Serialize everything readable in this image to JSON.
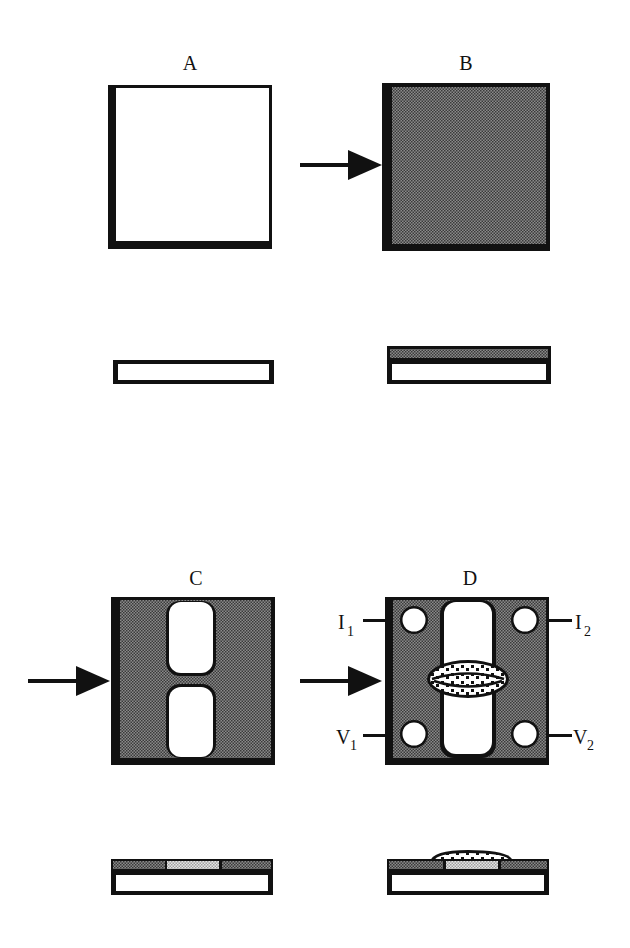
{
  "figure": {
    "panels": [
      {
        "id": "A",
        "label": "A",
        "description": "bare substrate, top view and cross-section"
      },
      {
        "id": "B",
        "label": "B",
        "description": "substrate coated with film (stippled), arrow indicating process step"
      },
      {
        "id": "C",
        "label": "C",
        "description": "film patterned into H-shaped structure with two rounded openings"
      },
      {
        "id": "D",
        "label": "D",
        "description": "four circular contacts with leads and deposited oval sample bridging the gap"
      }
    ],
    "contacts": {
      "i1": {
        "main": "I",
        "sub": "1"
      },
      "i2": {
        "main": "I",
        "sub": "2"
      },
      "v1": {
        "main": "V",
        "sub": "1"
      },
      "v2": {
        "main": "V",
        "sub": "2"
      }
    },
    "colors": {
      "outline": "#111111",
      "fill_dark_stipple": "#6e6e6e",
      "fill_light_stipple": "#c8c8c8",
      "background": "#ffffff"
    }
  }
}
